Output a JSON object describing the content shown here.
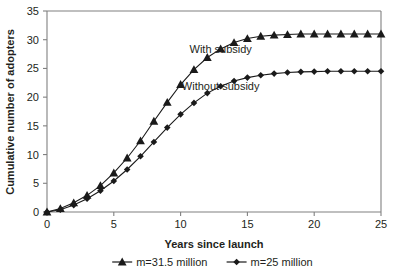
{
  "chart_data": {
    "type": "line",
    "title": "",
    "xlabel": "Years since launch",
    "ylabel": "Cumulative number of adopters",
    "xlim": [
      0,
      25
    ],
    "ylim": [
      0,
      35
    ],
    "xticks": [
      0,
      5,
      10,
      15,
      20,
      25
    ],
    "yticks": [
      0,
      5,
      10,
      15,
      20,
      25,
      30,
      35
    ],
    "grid": false,
    "legend_position": "bottom",
    "x": [
      0,
      1,
      2,
      3,
      4,
      5,
      6,
      7,
      8,
      9,
      10,
      11,
      12,
      13,
      14,
      15,
      16,
      17,
      18,
      19,
      20,
      21,
      22,
      23,
      24,
      25
    ],
    "series": [
      {
        "name": "m=31.5 million",
        "marker": "triangle",
        "annotation": "With subsidy",
        "color": "#1a1a1a",
        "values": [
          0,
          0.6,
          1.6,
          2.9,
          4.6,
          6.8,
          9.4,
          12.4,
          15.8,
          19.1,
          22.2,
          24.8,
          26.9,
          28.4,
          29.5,
          30.2,
          30.6,
          30.8,
          30.9,
          31.0,
          31.0,
          31.0,
          31.0,
          31.0,
          31.0,
          31.0
        ]
      },
      {
        "name": "m=25 million",
        "marker": "diamond",
        "annotation": "Without subsidy",
        "color": "#1a1a1a",
        "values": [
          0,
          0.4,
          1.2,
          2.3,
          3.7,
          5.4,
          7.4,
          9.7,
          12.2,
          14.7,
          17.0,
          19.0,
          20.7,
          21.9,
          22.8,
          23.4,
          23.8,
          24.1,
          24.3,
          24.4,
          24.45,
          24.5,
          24.5,
          24.5,
          24.5,
          24.5
        ]
      }
    ],
    "annotations": [
      {
        "text": "With subsidy",
        "x": 13.0,
        "y": 27.6
      },
      {
        "text": "Without subsidy",
        "x": 13.0,
        "y": 21.3
      }
    ]
  },
  "legend": {
    "items": [
      {
        "label": "m=31.5 million",
        "marker": "triangle"
      },
      {
        "label": "m=25 million",
        "marker": "diamond"
      }
    ]
  },
  "icons": {
    "triangle_marker": "triangle-marker-icon",
    "diamond_marker": "diamond-marker-icon"
  }
}
